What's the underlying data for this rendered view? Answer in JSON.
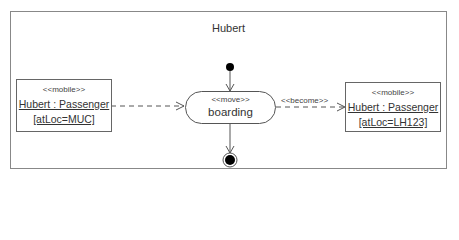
{
  "diagram": {
    "type": "UML activity diagram",
    "frame": {
      "title": "Hubert"
    },
    "nodes": {
      "initial": {
        "kind": "initial-node"
      },
      "source_object": {
        "stereotype": "<<mobile>>",
        "name": "Hubert : Passenger",
        "state": "[atLoc=MUC]"
      },
      "action": {
        "stereotype": "<<move>>",
        "label": "boarding"
      },
      "target_object": {
        "stereotype": "<<mobile>>",
        "name": "Hubert : Passenger",
        "state": "[atLoc=LH123]"
      },
      "final": {
        "kind": "activity-final-node"
      }
    },
    "edges": [
      {
        "from": "initial",
        "to": "action",
        "style": "solid"
      },
      {
        "from": "source_object",
        "to": "action",
        "style": "dashed"
      },
      {
        "from": "action",
        "to": "target_object",
        "style": "dashed",
        "label": "<<become>>"
      },
      {
        "from": "action",
        "to": "final",
        "style": "solid"
      }
    ],
    "colors": {
      "line": "#555555",
      "frame": "#888888",
      "fill": "#000000"
    }
  }
}
